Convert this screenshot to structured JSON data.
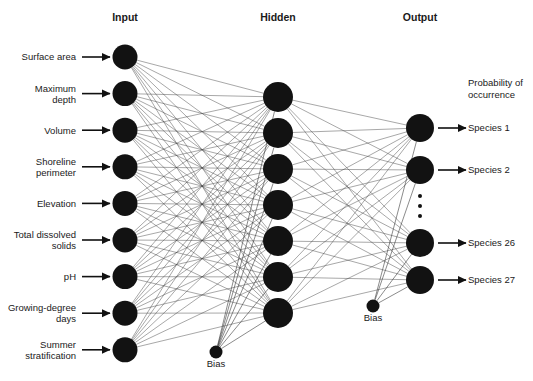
{
  "figure": {
    "type": "neural-network-diagram",
    "background_color": "#ffffff",
    "node_color": "#121212",
    "connection_color": "#3c3c3c",
    "text_color": "#1a1a1a"
  },
  "layer_titles": {
    "input": "Input",
    "hidden": "Hidden",
    "output": "Output"
  },
  "input_layer": {
    "node_count": 9,
    "labels": [
      "Surface area",
      "Maximum\ndepth",
      "Volume",
      "Shoreline\nperimeter",
      "Elevation",
      "Total dissolved\nsolids",
      "pH",
      "Growing-degree\ndays",
      "Summer\nstratification"
    ],
    "labels_flat": [
      [
        "Surface area"
      ],
      [
        "Maximum",
        "depth"
      ],
      [
        "Volume"
      ],
      [
        "Shoreline",
        "perimeter"
      ],
      [
        "Elevation"
      ],
      [
        "Total dissolved",
        "solids"
      ],
      [
        "pH"
      ],
      [
        "Growing-degree",
        "days"
      ],
      [
        "Summer",
        "stratification"
      ]
    ]
  },
  "hidden_layer": {
    "node_count": 7,
    "bias_label": "Bias"
  },
  "output_layer": {
    "node_count": 4,
    "ellipsis_count": 3,
    "bias_label": "Bias",
    "header_note": [
      "Probability of",
      "occurrence"
    ],
    "labels": [
      "Species 1",
      "Species 2",
      "Species 26",
      "Species 27"
    ]
  },
  "geometry": {
    "input_x": 125,
    "input_y_start": 57,
    "input_spacing": 36.6,
    "input_radius": 12.5,
    "hidden_x": 278,
    "hidden_y_start": 97,
    "hidden_spacing": 36,
    "hidden_radius": 15,
    "output_x": 420,
    "output_radius": 14,
    "output_ys": [
      128,
      170,
      243,
      280
    ],
    "ellipsis_ys": [
      196,
      206,
      216
    ],
    "hidden_bias": {
      "x": 216,
      "y": 352,
      "r": 6.5,
      "label_y": 367
    },
    "output_bias": {
      "x": 373,
      "y": 306,
      "r": 6.5,
      "label_y": 321
    },
    "title_y": 21,
    "input_arrow": {
      "x1": 82,
      "x2": 110
    },
    "output_arrow": {
      "x1": 438,
      "x2": 466
    },
    "note_x": 468,
    "note_ys": [
      86,
      98
    ]
  }
}
